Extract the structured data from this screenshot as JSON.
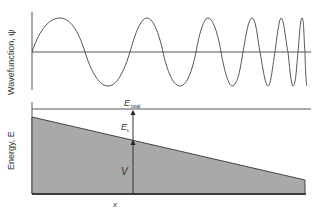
{
  "top_panel": {
    "ylabel": "Wavefunction, ψ"
  },
  "bottom_panel": {
    "ylabel": "Energy, E",
    "xlabel": "x",
    "e_total_main": "E",
    "e_total_sub": "total",
    "e_k_main": "E",
    "e_k_sub": "k",
    "v_label": "V"
  },
  "colors": {
    "line": "#555555",
    "fill": "#a9a9a9",
    "axis": "#333333"
  }
}
